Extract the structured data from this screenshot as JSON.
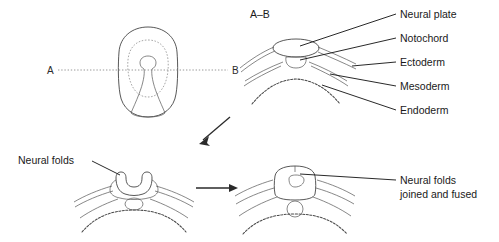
{
  "figure": {
    "title_section": "A–B",
    "background_color": "#ffffff",
    "line_color": "#3a3a3a",
    "text_color": "#1a1a1a"
  },
  "panel_embryo": {
    "name": "dorsal-view-embryo",
    "section_marker_left": "A",
    "section_marker_right": "B"
  },
  "panel_section_ab": {
    "heading": "A–B",
    "labels": [
      {
        "text": "Neural plate"
      },
      {
        "text": "Notochord"
      },
      {
        "text": "Ectoderm"
      },
      {
        "text": "Mesoderm"
      },
      {
        "text": "Endoderm"
      }
    ]
  },
  "panel_neural_folds": {
    "label": "Neural folds"
  },
  "panel_fused": {
    "label_line1": "Neural folds",
    "label_line2": "joined and fused"
  },
  "arrows": {
    "diagonal": "arrow-down-left",
    "horizontal": "arrow-right"
  }
}
